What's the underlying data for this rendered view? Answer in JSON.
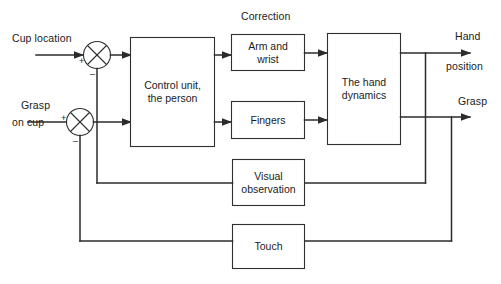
{
  "diagram": {
    "stroke_color": "#2b2b2b",
    "box_fill": "#ffffff",
    "background": "#ffffff",
    "inputs": [
      {
        "id": "cup-location",
        "label": "Cup location"
      },
      {
        "id": "grasp-on-cup",
        "label_line1": "Grasp",
        "label_line2": "on cup"
      }
    ],
    "outputs": [
      {
        "id": "hand-position",
        "label_line1": "Hand",
        "label_line2": "position"
      },
      {
        "id": "grasp",
        "label": "Grasp"
      }
    ],
    "annotations": [
      {
        "id": "correction",
        "label": "Correction"
      }
    ],
    "summing_junctions": [
      {
        "id": "sum-1",
        "plus": "+",
        "minus": "–"
      },
      {
        "id": "sum-2",
        "plus": "+",
        "minus": "–"
      }
    ],
    "blocks": [
      {
        "id": "control-unit",
        "label": "Control unit,\nthe person"
      },
      {
        "id": "arm-and-wrist",
        "label": "Arm and\nwrist"
      },
      {
        "id": "fingers",
        "label": "Fingers"
      },
      {
        "id": "hand-dynamics",
        "label": "The hand\ndynamics"
      },
      {
        "id": "visual-observation",
        "label": "Visual\nobservation"
      },
      {
        "id": "touch",
        "label": "Touch"
      }
    ]
  }
}
